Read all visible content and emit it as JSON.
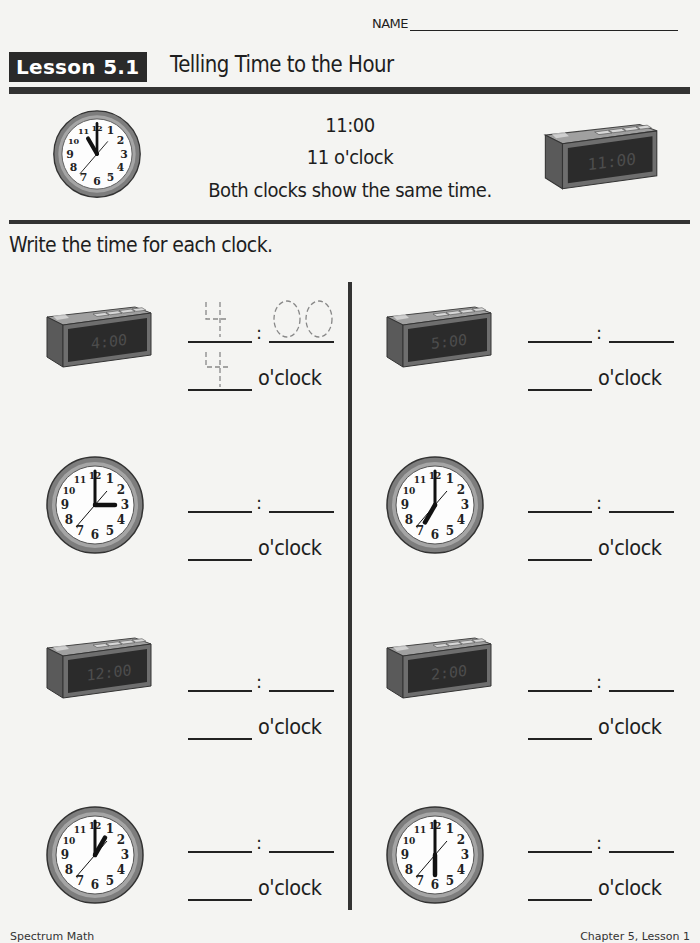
{
  "header": {
    "name_label": "NAME",
    "lesson_badge": "Lesson 5.1",
    "lesson_title": "Telling Time to the Hour"
  },
  "example": {
    "analog_clock": {
      "hour": 11,
      "minute": 0
    },
    "digital_clock": {
      "display": "11:00"
    },
    "time_text": "11:00",
    "oclock_text": "11 o'clock",
    "note": "Both clocks show the same time."
  },
  "instructions": "Write the time for each clock.",
  "answer_template": {
    "colon": ":",
    "oclock_label": "o'clock"
  },
  "problems": [
    {
      "id": 1,
      "type": "digital",
      "display": "4:00",
      "hour": 4,
      "minute": 0,
      "answer_hour": "4",
      "answer_minutes": "00",
      "answer_oclock": "4",
      "answers_traced": true
    },
    {
      "id": 2,
      "type": "digital",
      "display": "5:00",
      "hour": 5,
      "minute": 0,
      "answer_hour": "",
      "answer_minutes": "",
      "answer_oclock": "",
      "answers_traced": false
    },
    {
      "id": 3,
      "type": "analog",
      "hour": 3,
      "minute": 0,
      "answer_hour": "",
      "answer_minutes": "",
      "answer_oclock": "",
      "answers_traced": false
    },
    {
      "id": 4,
      "type": "analog",
      "hour": 7,
      "minute": 0,
      "answer_hour": "",
      "answer_minutes": "",
      "answer_oclock": "",
      "answers_traced": false
    },
    {
      "id": 5,
      "type": "digital",
      "display": "12:00",
      "hour": 12,
      "minute": 0,
      "answer_hour": "",
      "answer_minutes": "",
      "answer_oclock": "",
      "answers_traced": false
    },
    {
      "id": 6,
      "type": "digital",
      "display": "2:00",
      "hour": 2,
      "minute": 0,
      "answer_hour": "",
      "answer_minutes": "",
      "answer_oclock": "",
      "answers_traced": false
    },
    {
      "id": 7,
      "type": "analog",
      "hour": 1,
      "minute": 0,
      "answer_hour": "",
      "answer_minutes": "",
      "answer_oclock": "",
      "answers_traced": false
    },
    {
      "id": 8,
      "type": "analog",
      "hour": 6,
      "minute": 0,
      "answer_hour": "",
      "answer_minutes": "",
      "answer_oclock": "",
      "answers_traced": false
    }
  ],
  "clock_face_numbers": [
    "12",
    "1",
    "2",
    "3",
    "4",
    "5",
    "6",
    "7",
    "8",
    "9",
    "10",
    "11"
  ],
  "footer": {
    "left": "Spectrum Math",
    "right": "Chapter 5, Lesson 1"
  },
  "colors": {
    "page": "#f4f4f2",
    "ink": "#1e1e1e",
    "badge_bg": "#2a2a2a",
    "clock_rim": "#8a8a8a",
    "digital_body": "#6e6e6e",
    "digital_screen": "#2b2b2b"
  }
}
